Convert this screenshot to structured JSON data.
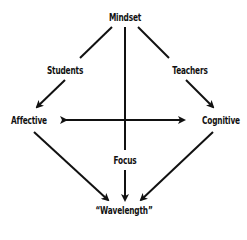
{
  "diagram": {
    "nodes": {
      "mindset": "Mindset",
      "students": "Students",
      "teachers": "Teachers",
      "affective": "Affective",
      "cognitive": "Cognitive",
      "focus": "Focus",
      "wavelength": "“Wavelength”"
    },
    "edges": [
      {
        "from": "Mindset",
        "to": "Affective",
        "via": "Students"
      },
      {
        "from": "Mindset",
        "to": "Cognitive",
        "via": "Teachers"
      },
      {
        "from": "Mindset",
        "to": "Wavelength",
        "via": "Focus"
      },
      {
        "from": "Affective",
        "to": "Cognitive",
        "bidirectional": true
      },
      {
        "from": "Affective",
        "to": "Wavelength"
      },
      {
        "from": "Cognitive",
        "to": "Wavelength"
      }
    ],
    "line_color": "#111111"
  }
}
